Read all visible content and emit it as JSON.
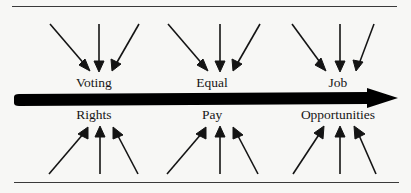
{
  "diagram": {
    "type": "converging-arrows-timeline",
    "title": "",
    "background_color": "#f7f7f5",
    "ink_color": "#161616",
    "main_axis": {
      "name": "main-arrow",
      "direction": "left-to-right",
      "style": "thick-solid-black",
      "color": "#000000"
    },
    "rules": {
      "top_label": "top-divider-line",
      "bottom_label": "bottom-divider-line",
      "color": "#3a3a3a"
    },
    "groups": [
      {
        "id": "group-1",
        "label_above": "Voting",
        "label_below": "Rights",
        "full_phrase": "Voting Rights",
        "arrows_above": 3,
        "arrows_below": 3,
        "arrows_above_direction": "down-converging",
        "arrows_below_direction": "up-converging"
      },
      {
        "id": "group-2",
        "label_above": "Equal",
        "label_below": "Pay",
        "full_phrase": "Equal Pay",
        "arrows_above": 3,
        "arrows_below": 3,
        "arrows_above_direction": "down-converging",
        "arrows_below_direction": "up-converging"
      },
      {
        "id": "group-3",
        "label_above": "Job",
        "label_below": "Opportunities",
        "full_phrase": "Job Opportunities",
        "arrows_above": 3,
        "arrows_below": 3,
        "arrows_above_direction": "down-converging",
        "arrows_below_direction": "up-converging"
      }
    ]
  }
}
